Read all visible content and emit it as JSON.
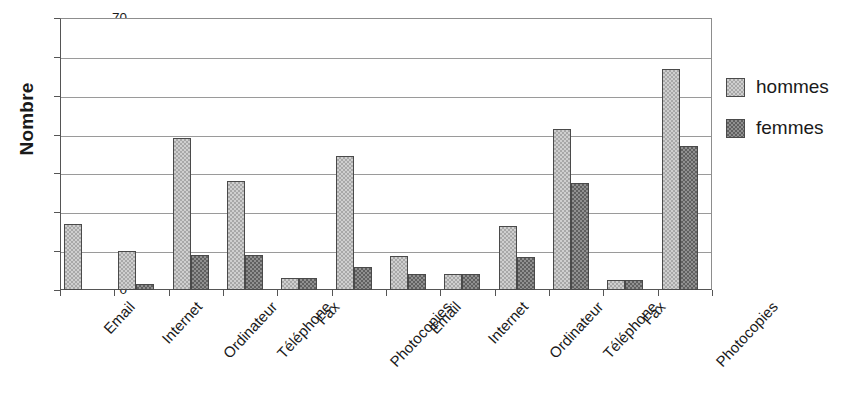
{
  "chart_data": {
    "type": "bar",
    "title": "",
    "xlabel": "",
    "ylabel": "Nombre",
    "ylim": [
      0,
      70
    ],
    "ytick_labels": [
      "70",
      "60",
      "50",
      "40",
      "30",
      "20",
      "10",
      "0"
    ],
    "ytick_values": [
      70,
      60,
      50,
      40,
      30,
      20,
      10,
      0
    ],
    "grid": true,
    "legend_position": "right",
    "categories": [
      "Email",
      "Internet",
      "Ordinateur",
      "Téléphone",
      "Fax",
      "Photocopies",
      "Email",
      "Internet",
      "Ordinateur",
      "Téléphone",
      "Fax",
      "Photocopies"
    ],
    "series": [
      {
        "name": "hommes",
        "color": "#cfcfcf",
        "values": [
          17,
          10,
          39,
          28,
          3,
          34.5,
          8.7,
          4,
          16.5,
          41.5,
          2.5,
          57
        ]
      },
      {
        "name": "femmes",
        "color": "#909090",
        "values": [
          0,
          1.5,
          9,
          9,
          3,
          6,
          4,
          4,
          8.5,
          27.5,
          2.5,
          37
        ]
      }
    ]
  },
  "legend": {
    "entries": [
      {
        "label": "hommes"
      },
      {
        "label": "femmes"
      }
    ]
  }
}
